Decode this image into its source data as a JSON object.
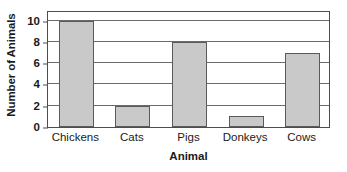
{
  "chart_data": {
    "type": "bar",
    "title": "",
    "xlabel": "Animal",
    "ylabel": "Number of Animals",
    "categories": [
      "Chickens",
      "Cats",
      "Pigs",
      "Donkeys",
      "Cows"
    ],
    "values": [
      10,
      2,
      8,
      1,
      7
    ],
    "ylim": [
      0,
      11
    ],
    "yticks": [
      0,
      2,
      4,
      6,
      8,
      10
    ],
    "ytick_labels": [
      "0",
      "2",
      "4",
      "6",
      "8",
      "10"
    ],
    "grid": true,
    "grid_axis": "y",
    "legend": null,
    "legend_position": "none",
    "bar_color": "#c9c9c9",
    "bar_edge_color": "#5a5a5a",
    "axis_color": "#4d4d4d",
    "gridline_color": "#6b6b6b",
    "text_color": "#1a1a1a",
    "background": "#ffffff"
  }
}
